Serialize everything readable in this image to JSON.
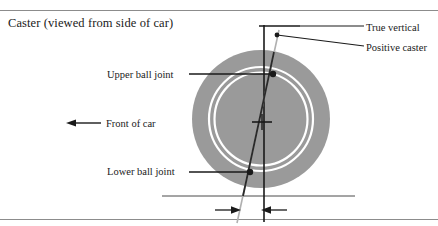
{
  "figure": {
    "caption": "Caster (viewed from side of car)",
    "width": 438,
    "height": 226
  },
  "labels": {
    "upper_ball_joint": "Upper ball joint",
    "lower_ball_joint": "Lower ball joint",
    "front_of_car": "Front of car",
    "true_vertical": "True vertical",
    "positive_caster": "Positive caster"
  },
  "colors": {
    "tire_fill": "#9a9a9a",
    "rim_stroke": "#ffffff",
    "line": "#1a1a1a",
    "rule": "#8c8c8c",
    "steering_axis": "#4d4d4d",
    "background": "#ffffff"
  },
  "geometry": {
    "tire": {
      "cx": 261,
      "cy": 119,
      "r": 69
    },
    "rim_outer_r": 52,
    "rim_inner_r": 47,
    "hub": {
      "x": 262,
      "y": 122
    },
    "true_vertical_line": {
      "x": 264,
      "y_top": 25,
      "y_bottom": 222
    },
    "upper_ball_joint_point": {
      "x": 272,
      "y": 74
    },
    "lower_ball_joint_point": {
      "x": 251,
      "y": 172
    },
    "steering_axis": {
      "x_top": 277,
      "y_top": 33,
      "x_bottom": 238,
      "y_bottom": 222
    },
    "ground_line": {
      "x_start": 162,
      "x_end": 355,
      "y": 196
    },
    "dimension_arrows_y": 210,
    "caster_offset_left_x": 242,
    "caster_offset_right_x": 264
  }
}
